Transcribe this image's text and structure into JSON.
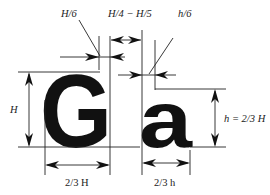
{
  "diagram": {
    "colors": {
      "ink": "#111111",
      "line": "#222222",
      "background": "#ffffff"
    },
    "glyphs": [
      {
        "id": "uppercase",
        "char": "G"
      },
      {
        "id": "lowercase",
        "char": "a"
      }
    ],
    "labels": {
      "stroke_uppercase": "H/6",
      "gap": "H/4 − H/5",
      "stroke_lowercase": "h/6",
      "cap_height": "H",
      "x_height": "h = 2/3 H",
      "width_uppercase": "2/3 H",
      "width_lowercase": "2/3 h"
    }
  }
}
